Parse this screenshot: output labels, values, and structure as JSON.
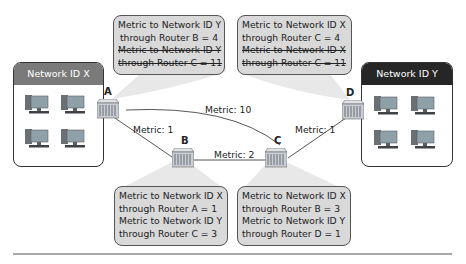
{
  "networks": [
    {
      "id": "x",
      "label": "Network ID X",
      "header_color": "#7a7a7a"
    },
    {
      "id": "y",
      "label": "Network ID Y",
      "header_color": "#262626"
    }
  ],
  "routers": [
    {
      "id": "A",
      "label": "A"
    },
    {
      "id": "B",
      "label": "B"
    },
    {
      "id": "C",
      "label": "C"
    },
    {
      "id": "D",
      "label": "D"
    }
  ],
  "links": [
    {
      "from": "A",
      "to": "C",
      "metric_label": "Metric: 10"
    },
    {
      "from": "A",
      "to": "B",
      "metric_label": "Metric: 1"
    },
    {
      "from": "B",
      "to": "C",
      "metric_label": "Metric: 2"
    },
    {
      "from": "C",
      "to": "D",
      "metric_label": "Metric: 1"
    }
  ],
  "callouts": {
    "A": {
      "lines": [
        {
          "text": "Metric to Network ID Y",
          "struck": false
        },
        {
          "text": "through Router B = 4",
          "struck": false
        },
        {
          "text": "Metric to Network ID Y",
          "struck": true
        },
        {
          "text": "through Router C = 11",
          "struck": true
        }
      ]
    },
    "D": {
      "lines": [
        {
          "text": "Metric to Network ID X",
          "struck": false
        },
        {
          "text": "through Router C = 4",
          "struck": false
        },
        {
          "text": "Metric to Network ID X",
          "struck": true
        },
        {
          "text": "through Router C = 11",
          "struck": true
        }
      ]
    },
    "B": {
      "lines": [
        {
          "text": "Metric to Network ID X",
          "struck": false
        },
        {
          "text": "through Router A = 1",
          "struck": false
        },
        {
          "text": "Metric to Network ID Y",
          "struck": false
        },
        {
          "text": "through Router C = 3",
          "struck": false
        }
      ]
    },
    "C": {
      "lines": [
        {
          "text": "Metric to Network ID X",
          "struck": false
        },
        {
          "text": "through Router B = 3",
          "struck": false
        },
        {
          "text": "Metric to Network ID Y",
          "struck": false
        },
        {
          "text": "through Router D = 1",
          "struck": false
        }
      ]
    }
  },
  "colors": {
    "callout_fill": "#d9d9d9",
    "callout_beam": "#e6e6e6",
    "router_fill": "#c8cdd3",
    "pc_body": "#6b7075",
    "pc_screen": "#8fa1a8"
  }
}
